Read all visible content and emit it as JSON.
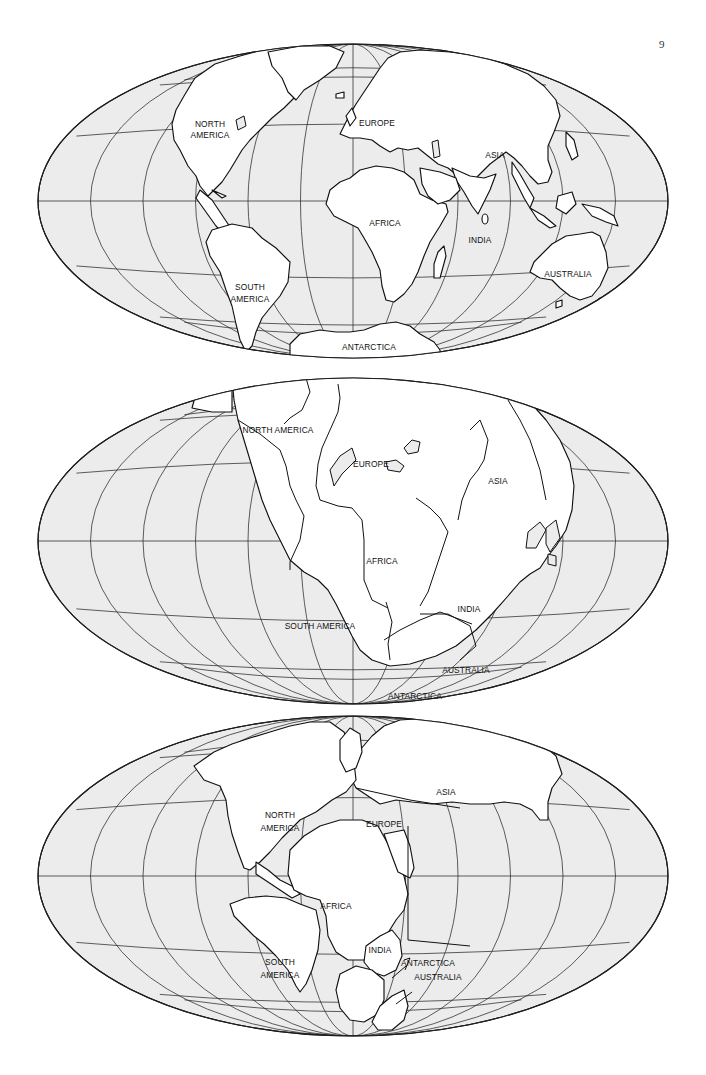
{
  "page": {
    "number": "9"
  },
  "colors": {
    "ocean": "#ececec",
    "land": "#ffffff",
    "line": "#1e1e1e"
  },
  "maps": [
    {
      "id": "present-day",
      "description": "Present-day arrangement of the continents",
      "labels": {
        "north_america": [
          "NORTH",
          "AMERICA"
        ],
        "south_america": [
          "SOUTH",
          "AMERICA"
        ],
        "europe": "EUROPE",
        "africa": "AFRICA",
        "asia": "ASIA",
        "india": "INDIA",
        "australia": "AUSTRALIA",
        "antarctica": "ANTARCTICA"
      }
    },
    {
      "id": "pangaea",
      "description": "Continents assembled into a single supercontinent",
      "labels": {
        "north_america": "NORTH AMERICA",
        "south_america": "SOUTH AMERICA",
        "europe": "EUROPE",
        "africa": "AFRICA",
        "asia": "ASIA",
        "india": "INDIA",
        "australia": "AUSTRALIA",
        "antarctica": "ANTARCTICA"
      }
    },
    {
      "id": "intermediate",
      "description": "Continents partly separated (break-up of the supercontinent)",
      "labels": {
        "north_america": [
          "NORTH",
          "AMERICA"
        ],
        "south_america": [
          "SOUTH",
          "AMERICA"
        ],
        "europe": "EUROPE",
        "africa": "AFRICA",
        "asia": "ASIA",
        "india": "INDIA",
        "antarctica": "ANTARCTICA",
        "australia": "AUSTRALIA"
      }
    }
  ],
  "graticule": {
    "meridian_count": 13,
    "parallels_deg": [
      -60,
      -30,
      0,
      30,
      60
    ]
  }
}
